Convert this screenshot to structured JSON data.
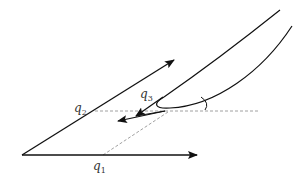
{
  "diagram": {
    "labels": {
      "q1": {
        "base": "q",
        "sub": "1"
      },
      "q2": {
        "base": "q",
        "sub": "2"
      },
      "q3": {
        "base": "q",
        "sub": "3"
      }
    },
    "colors": {
      "stroke": "#111111",
      "dashed": "#888888",
      "text": "#333333"
    }
  }
}
